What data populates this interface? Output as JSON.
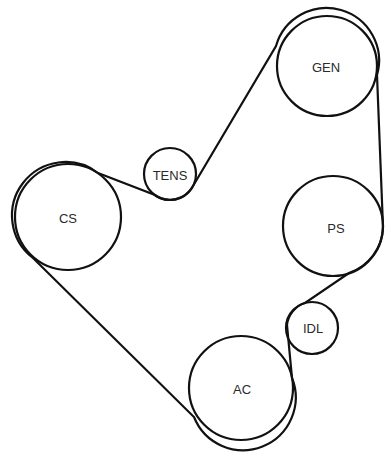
{
  "diagram": {
    "type": "serpentine-belt-routing",
    "background": "#ffffff",
    "stroke_color": "#111111",
    "pulleys": [
      {
        "id": "cs",
        "label": "CS",
        "cx": 68,
        "cy": 217,
        "r": 53
      },
      {
        "id": "tens",
        "label": "TENS",
        "cx": 170,
        "cy": 174,
        "r": 26
      },
      {
        "id": "gen",
        "label": "GEN",
        "cx": 327,
        "cy": 66,
        "r": 50
      },
      {
        "id": "ps",
        "label": "PS",
        "cx": 333,
        "cy": 226,
        "r": 50
      },
      {
        "id": "idl",
        "label": "IDL",
        "cx": 312,
        "cy": 328,
        "r": 26
      },
      {
        "id": "ac",
        "label": "AC",
        "cx": 241,
        "cy": 388,
        "r": 52
      }
    ],
    "belt_route": [
      "CS",
      "TENS",
      "GEN",
      "PS",
      "IDL",
      "AC",
      "CS"
    ]
  }
}
